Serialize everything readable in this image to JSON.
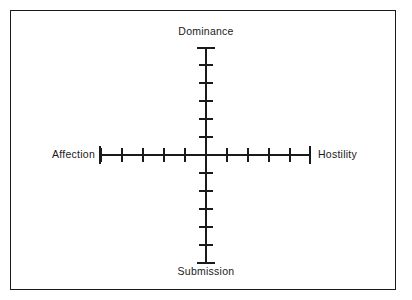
{
  "figure": {
    "kind": "axis-cross-diagram",
    "background_color": "#ffffff",
    "stroke_color": "#1a1a1a",
    "frame": {
      "name": "figure-border",
      "x": 10,
      "y": 10,
      "width": 386,
      "height": 280,
      "stroke_width": 1.4
    }
  },
  "labels": {
    "top": "Dominance",
    "bottom": "Submission",
    "left": "Affection",
    "right": "Hostility"
  },
  "chart_data": {
    "type": "scatter",
    "title": "",
    "subtitle": "",
    "xlabel": "",
    "ylabel": "",
    "grid": false,
    "legend": null,
    "annotations": [],
    "series": [],
    "x": [],
    "values": [],
    "axes": {
      "horizontal": {
        "negative_pole_label": "Affection",
        "positive_pole_label": "Hostility",
        "tick_count_negative": 5,
        "tick_count_positive": 5,
        "tick_labels": [],
        "xlim": [
          -5,
          5
        ]
      },
      "vertical": {
        "positive_pole_label": "Dominance",
        "negative_pole_label": "Submission",
        "tick_count_positive": 5,
        "tick_count_negative": 5,
        "tick_labels": [],
        "ylim": [
          -5,
          5
        ]
      }
    },
    "geometry": {
      "center_x": 206,
      "center_y": 155,
      "x_axis_left": 100,
      "x_axis_right": 310,
      "y_axis_top": 48,
      "y_axis_bottom": 263,
      "x_tick_spacing": 21,
      "y_tick_spacing": 18,
      "tick_half_length": 7,
      "cap_half_length": 9,
      "axis_stroke_width": 1.4,
      "tick_stroke_width": 1.4
    }
  }
}
